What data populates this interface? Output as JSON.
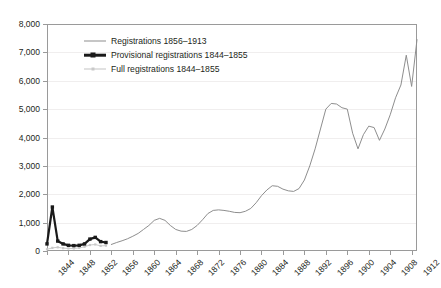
{
  "chart_data": {
    "type": "line",
    "title": "",
    "subtitle": "",
    "xlabel": "",
    "ylabel": "",
    "xlim": [
      1844,
      1913
    ],
    "ylim": [
      0,
      8000
    ],
    "grid": true,
    "legend_position": "top-left inside plot",
    "x_ticks": [
      1844,
      1848,
      1852,
      1856,
      1860,
      1864,
      1868,
      1872,
      1876,
      1880,
      1884,
      1888,
      1892,
      1896,
      1900,
      1904,
      1908,
      1912
    ],
    "x_tick_labels": [
      "1844",
      "1848",
      "1852",
      "1856",
      "1860",
      "1864",
      "1868",
      "1872",
      "1876",
      "1880",
      "1884",
      "1888",
      "1892",
      "1896",
      "1900",
      "1904",
      "1908",
      "1912"
    ],
    "y_ticks": [
      0,
      1000,
      2000,
      3000,
      4000,
      5000,
      6000,
      7000,
      8000
    ],
    "y_tick_labels": [
      "0",
      "1,000",
      "2,000",
      "3,000",
      "4,000",
      "5,000",
      "6,000",
      "7,000",
      "8,000"
    ],
    "series": [
      {
        "name": "Registrations 1856–1913",
        "color": "#8e8e8e",
        "style": "thin-line",
        "x": [
          1856,
          1857,
          1858,
          1859,
          1860,
          1861,
          1862,
          1863,
          1864,
          1865,
          1866,
          1867,
          1868,
          1869,
          1870,
          1871,
          1872,
          1873,
          1874,
          1875,
          1876,
          1877,
          1878,
          1879,
          1880,
          1881,
          1882,
          1883,
          1884,
          1885,
          1886,
          1887,
          1888,
          1889,
          1890,
          1891,
          1892,
          1893,
          1894,
          1895,
          1896,
          1897,
          1898,
          1899,
          1900,
          1901,
          1902,
          1903,
          1904,
          1905,
          1906,
          1907,
          1908,
          1909,
          1910,
          1911,
          1912,
          1913
        ],
        "values": [
          230,
          300,
          360,
          430,
          520,
          620,
          760,
          900,
          1080,
          1150,
          1080,
          900,
          760,
          700,
          690,
          760,
          900,
          1100,
          1320,
          1430,
          1450,
          1430,
          1400,
          1360,
          1350,
          1400,
          1500,
          1700,
          1950,
          2150,
          2300,
          2280,
          2180,
          2120,
          2100,
          2200,
          2500,
          3000,
          3600,
          4300,
          5000,
          5200,
          5180,
          5050,
          5000,
          4150,
          3600,
          4100,
          4400,
          4350,
          3900,
          4300,
          4800,
          5400,
          5850,
          6900,
          5800,
          7450
        ]
      },
      {
        "name": "Provisional registrations 1844–1855",
        "color": "#1a1a1a",
        "style": "thick-line-square-markers",
        "x": [
          1844,
          1845,
          1846,
          1847,
          1848,
          1849,
          1850,
          1851,
          1852,
          1853,
          1854,
          1855
        ],
        "values": [
          250,
          1550,
          350,
          250,
          200,
          190,
          200,
          250,
          420,
          480,
          330,
          300
        ]
      },
      {
        "name": "Full registrations 1844–1855",
        "color": "#c9c9c9",
        "style": "light-line-small-markers",
        "x": [
          1844,
          1845,
          1846,
          1847,
          1848,
          1849,
          1850,
          1851,
          1852,
          1853,
          1854,
          1855
        ],
        "values": [
          60,
          110,
          130,
          100,
          90,
          90,
          110,
          150,
          210,
          230,
          180,
          190
        ]
      }
    ]
  },
  "legend": {
    "items": [
      {
        "label": "Registrations 1856–1913"
      },
      {
        "label": "Provisional registrations 1844–1855"
      },
      {
        "label": "Full registrations 1844–1855"
      }
    ]
  }
}
